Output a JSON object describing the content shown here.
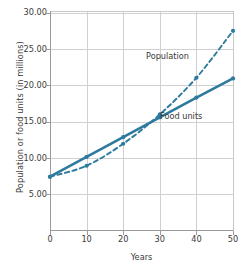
{
  "chart_data": {
    "type": "line",
    "title": "",
    "xlabel": "Years",
    "ylabel": "Population or food units (in millions)",
    "x": [
      0,
      10,
      20,
      30,
      40,
      50
    ],
    "xlim": [
      0,
      50
    ],
    "ylim": [
      0,
      30
    ],
    "xticks": [
      "0",
      "10",
      "20",
      "30",
      "40",
      "50"
    ],
    "yticks": [
      "5.00",
      "10.00",
      "15.00",
      "20.00",
      "25.00",
      "30.00"
    ],
    "ytick_values": [
      5,
      10,
      15,
      20,
      25,
      30
    ],
    "grid": true,
    "legend_position": "inline-annotations",
    "series": [
      {
        "name": "Food units",
        "style": "solid",
        "values": [
          7.4,
          10.1,
          12.8,
          15.5,
          18.2,
          20.8
        ],
        "annotation": "Food units",
        "color": "#2d7a9e"
      },
      {
        "name": "Population",
        "style": "dashed",
        "values": [
          7.4,
          8.9,
          11.9,
          15.9,
          20.9,
          27.3
        ],
        "annotation": "Population",
        "color": "#2d7a9e"
      }
    ],
    "accent_color": "#2d7a9e",
    "grid_color": "#d0d0d0",
    "axis_color": "#9a9a9a"
  }
}
